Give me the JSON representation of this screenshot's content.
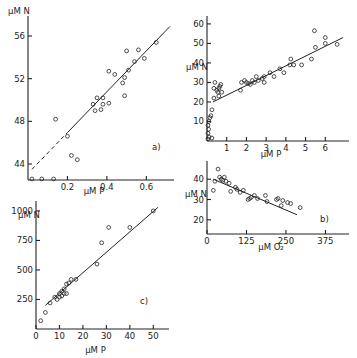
{
  "chart_data": [
    {
      "type": "scatter",
      "panel": "a)",
      "xlabel": "μM P",
      "ylabel": "μM N",
      "xticks": [
        "0.2",
        "0.4",
        "0.6"
      ],
      "yticks": [
        "44",
        "48",
        "52",
        "56"
      ],
      "xlim": [
        0,
        0.72
      ],
      "ylim": [
        42.5,
        57.5
      ],
      "points": [
        [
          0.02,
          42.6
        ],
        [
          0.07,
          42.6
        ],
        [
          0.13,
          42.6
        ],
        [
          0.14,
          48.2
        ],
        [
          0.2,
          46.6
        ],
        [
          0.22,
          44.8
        ],
        [
          0.25,
          44.4
        ],
        [
          0.33,
          49.6
        ],
        [
          0.34,
          49.0
        ],
        [
          0.35,
          50.2
        ],
        [
          0.37,
          49.1
        ],
        [
          0.38,
          50.2
        ],
        [
          0.38,
          49.6
        ],
        [
          0.41,
          49.7
        ],
        [
          0.41,
          52.7
        ],
        [
          0.44,
          52.4
        ],
        [
          0.48,
          51.6
        ],
        [
          0.49,
          52.1
        ],
        [
          0.49,
          50.4
        ],
        [
          0.5,
          54.6
        ],
        [
          0.51,
          52.8
        ],
        [
          0.54,
          53.6
        ],
        [
          0.56,
          54.7
        ],
        [
          0.59,
          53.9
        ],
        [
          0.65,
          55.4
        ]
      ],
      "fit_line": {
        "x": [
          0.02,
          0.72
        ],
        "y": [
          43.5,
          56.9
        ],
        "dashed_below_x": 0.2
      }
    },
    {
      "type": "scatter",
      "panel": "",
      "xlabel": "μM P",
      "ylabel": "μM N",
      "xticks": [
        "1",
        "2",
        "3",
        "4",
        "5",
        "6"
      ],
      "yticks": [
        "10",
        "20",
        "30",
        "40",
        "50",
        "60"
      ],
      "xlim": [
        0,
        7
      ],
      "ylim": [
        0,
        62
      ],
      "points": [
        [
          0.05,
          1
        ],
        [
          0.1,
          2
        ],
        [
          0.25,
          1.5
        ],
        [
          0.05,
          4
        ],
        [
          0.08,
          6
        ],
        [
          0.05,
          8
        ],
        [
          0.1,
          10
        ],
        [
          0.15,
          12
        ],
        [
          0.2,
          13
        ],
        [
          0.25,
          16
        ],
        [
          0.35,
          22
        ],
        [
          0.35,
          27
        ],
        [
          0.4,
          30
        ],
        [
          0.5,
          26
        ],
        [
          0.55,
          25
        ],
        [
          0.6,
          27
        ],
        [
          0.65,
          28
        ],
        [
          0.7,
          29
        ],
        [
          0.75,
          25
        ],
        [
          0.6,
          23
        ],
        [
          1.7,
          26
        ],
        [
          1.75,
          30
        ],
        [
          1.9,
          31
        ],
        [
          2.0,
          30
        ],
        [
          2.1,
          29.5
        ],
        [
          2.2,
          29
        ],
        [
          2.3,
          31
        ],
        [
          2.4,
          30
        ],
        [
          2.5,
          33
        ],
        [
          2.6,
          31
        ],
        [
          2.8,
          32
        ],
        [
          2.9,
          30
        ],
        [
          2.9,
          33
        ],
        [
          3.2,
          35
        ],
        [
          3.4,
          33
        ],
        [
          3.7,
          37
        ],
        [
          3.9,
          35
        ],
        [
          4.2,
          39
        ],
        [
          4.25,
          42
        ],
        [
          4.4,
          39
        ],
        [
          4.8,
          39
        ],
        [
          5.3,
          42
        ],
        [
          5.5,
          48
        ],
        [
          5.45,
          56.5
        ],
        [
          6.0,
          50
        ],
        [
          6.0,
          53
        ],
        [
          6.6,
          49.5
        ]
      ],
      "fit_line": {
        "x": [
          0.3,
          6.9
        ],
        "y": [
          20,
          53
        ]
      }
    },
    {
      "type": "scatter",
      "panel": "b)",
      "xlabel": "μM O₂",
      "ylabel": "μM N",
      "xticks": [
        "0",
        "125",
        "250",
        "375"
      ],
      "yticks": [
        "20",
        "30",
        "40"
      ],
      "xlim": [
        0,
        450
      ],
      "ylim": [
        13,
        47
      ],
      "points": [
        [
          20,
          34.5
        ],
        [
          25,
          39
        ],
        [
          35,
          45
        ],
        [
          40,
          41
        ],
        [
          45,
          40
        ],
        [
          50,
          39.5
        ],
        [
          55,
          41
        ],
        [
          60,
          39
        ],
        [
          70,
          38
        ],
        [
          75,
          34
        ],
        [
          90,
          36
        ],
        [
          95,
          35
        ],
        [
          105,
          33.5
        ],
        [
          115,
          34.5
        ],
        [
          130,
          30
        ],
        [
          135,
          30.5
        ],
        [
          140,
          31
        ],
        [
          150,
          32
        ],
        [
          160,
          30.5
        ],
        [
          185,
          32
        ],
        [
          190,
          29
        ],
        [
          220,
          30
        ],
        [
          225,
          30.5
        ],
        [
          235,
          27
        ],
        [
          240,
          29.5
        ],
        [
          255,
          28.5
        ],
        [
          265,
          28
        ],
        [
          295,
          26
        ]
      ],
      "fit_line": {
        "x": [
          20,
          285
        ],
        "y": [
          40,
          22.5
        ]
      }
    },
    {
      "type": "scatter",
      "panel": "c)",
      "xlabel": "μM P",
      "ylabel": "μM N",
      "xticks": [
        "0",
        "10",
        "20",
        "30",
        "40",
        "50"
      ],
      "yticks": [
        "250",
        "500",
        "750",
        "1000"
      ],
      "xlim": [
        0,
        53
      ],
      "ylim": [
        0,
        1050
      ],
      "points": [
        [
          2,
          70
        ],
        [
          4,
          140
        ],
        [
          6,
          220
        ],
        [
          8,
          270
        ],
        [
          9,
          250
        ],
        [
          10,
          270
        ],
        [
          10,
          300
        ],
        [
          11,
          280
        ],
        [
          11,
          320
        ],
        [
          12,
          300
        ],
        [
          12,
          340
        ],
        [
          13,
          300
        ],
        [
          13,
          380
        ],
        [
          14,
          390
        ],
        [
          15,
          420
        ],
        [
          17,
          420
        ],
        [
          26,
          550
        ],
        [
          28,
          730
        ],
        [
          31,
          860
        ],
        [
          40,
          860
        ],
        [
          50,
          1000
        ]
      ],
      "fit_line": {
        "x": [
          4,
          52
        ],
        "y": [
          200,
          1030
        ]
      }
    }
  ]
}
